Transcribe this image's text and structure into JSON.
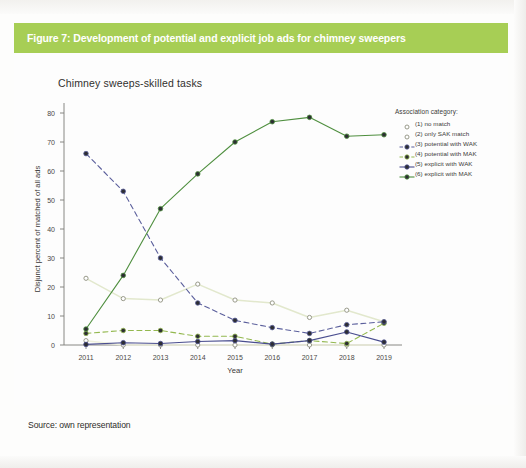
{
  "figure": {
    "caption": "Figure 7: Development of potential and explicit job ads for chimney sweepers",
    "caption_bar_color": "#a7ce55",
    "source": "Source: own representation"
  },
  "legend": {
    "title": "Association category:",
    "entries": [
      {
        "label": "(1) no match",
        "color": "#eef0dc",
        "style": "dotted",
        "marker": "open"
      },
      {
        "label": "(2) only SAK match",
        "color": "#e2e8cd",
        "style": "dotted",
        "marker": "open"
      },
      {
        "label": "(3) potential with WAK",
        "color": "#5b5f9c",
        "style": "dashed",
        "marker": "filled"
      },
      {
        "label": "(4) potential with MAK",
        "color": "#93b84f",
        "style": "dashed",
        "marker": "filled"
      },
      {
        "label": "(5) explicit with WAK",
        "color": "#4a4e8f",
        "style": "solid",
        "marker": "filled"
      },
      {
        "label": "(6) explicit with MAK",
        "color": "#4f8f3f",
        "style": "solid",
        "marker": "filled"
      }
    ]
  },
  "chart_data": {
    "type": "line",
    "title": "Chimney sweeps-skilled tasks",
    "xlabel": "Year",
    "ylabel": "Disjunct percent of matched of all ads",
    "categories": [
      "2011",
      "2012",
      "2013",
      "2014",
      "2015",
      "2016",
      "2017",
      "2018",
      "2019"
    ],
    "x_tick_labels": [
      "2011",
      "2012",
      "2013",
      "2014",
      "2015",
      "2016",
      "2017",
      "2018",
      "2019"
    ],
    "y_tick_labels": [
      "0",
      "10",
      "20",
      "30",
      "40",
      "50",
      "60",
      "70",
      "80"
    ],
    "y_ticks": [
      0,
      10,
      20,
      30,
      40,
      50,
      60,
      70,
      80
    ],
    "ylim": [
      -2,
      84
    ],
    "xlim": [
      2010.6,
      2019.4
    ],
    "grid": false,
    "legend_position": "right",
    "series": [
      {
        "name": "(1) no match",
        "color": "#eef0dc",
        "style": "dotted",
        "marker": "open",
        "values": [
          1.5,
          0,
          0,
          0,
          0,
          0,
          0,
          0,
          0
        ]
      },
      {
        "name": "(2) only SAK match",
        "color": "#e2e8cd",
        "style": "dotted",
        "marker": "open",
        "values": [
          23,
          16,
          15.5,
          21,
          15.5,
          14.5,
          9.5,
          12,
          8
        ]
      },
      {
        "name": "(3) potential with WAK",
        "color": "#5b5f9c",
        "style": "dashed",
        "marker": "filled",
        "values": [
          66,
          53,
          30,
          14.5,
          8.5,
          6,
          4,
          7,
          8
        ]
      },
      {
        "name": "(4) potential with MAK",
        "color": "#93b84f",
        "style": "dashed",
        "marker": "filled",
        "values": [
          4,
          5,
          5,
          3,
          3,
          0.3,
          1.5,
          0.5,
          7.5
        ]
      },
      {
        "name": "(5) explicit with WAK",
        "color": "#4a4e8f",
        "style": "solid",
        "marker": "filled",
        "values": [
          0.2,
          0.8,
          0.5,
          1.2,
          1.5,
          0.3,
          1.5,
          4.5,
          1
        ]
      },
      {
        "name": "(6) explicit with MAK",
        "color": "#4f8f3f",
        "style": "solid",
        "marker": "filled",
        "values": [
          5.5,
          24,
          47,
          59,
          70,
          77,
          78.5,
          72,
          72.5
        ]
      }
    ]
  }
}
